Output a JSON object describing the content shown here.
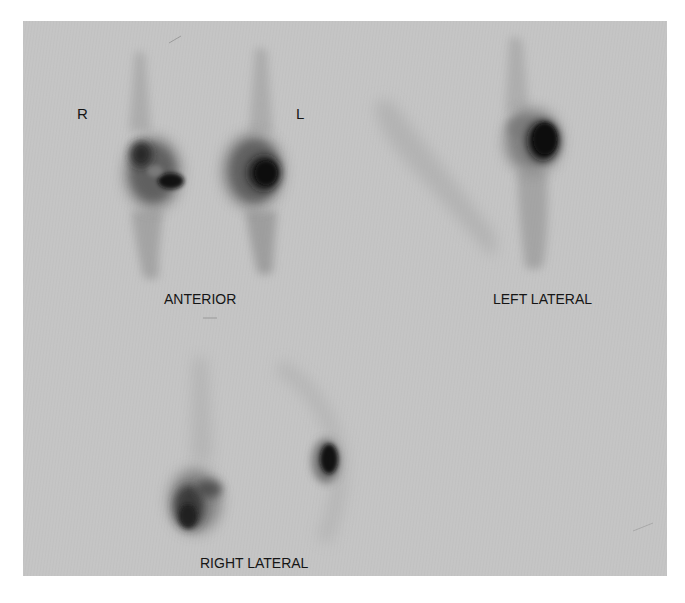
{
  "figure": {
    "type": "nuclear-medicine-bone-scan",
    "background_color": "#c6c6c6",
    "uptake_color": "#111111",
    "panels": [
      {
        "id": "anterior",
        "label": "ANTERIOR",
        "side_markers": [
          "R",
          "L"
        ]
      },
      {
        "id": "left-lateral",
        "label": "LEFT LATERAL"
      },
      {
        "id": "right-lateral",
        "label": "RIGHT LATERAL"
      }
    ]
  },
  "labels": {
    "right_marker": "R",
    "left_marker": "L",
    "anterior": "ANTERIOR",
    "left_lateral": "LEFT LATERAL",
    "right_lateral": "RIGHT LATERAL"
  }
}
